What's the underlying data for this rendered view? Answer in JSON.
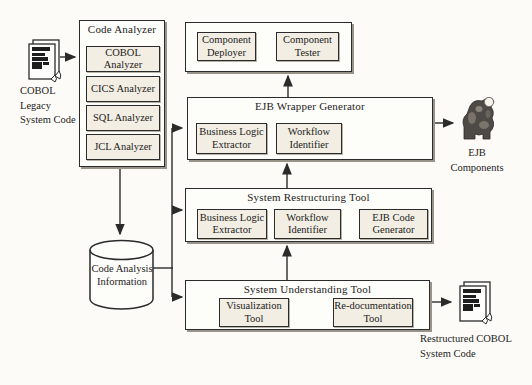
{
  "colors": {
    "line": "#2b2b2b",
    "outer_box_fill": "#fdfdfa",
    "inner_box_fill": "#f2eee4",
    "background": "#fcfbf8"
  },
  "nodes": {
    "cobol_legacy_code": {
      "icon": "document-stack-icon",
      "label": "COBOL\nLegacy\nSystem Code"
    },
    "code_analyzer": {
      "title": "Code Analyzer",
      "analyzers": [
        {
          "label": "COBOL Analyzer"
        },
        {
          "label": "CICS Analyzer"
        },
        {
          "label": "SQL Analyzer"
        },
        {
          "label": "JCL Analyzer"
        }
      ]
    },
    "component_group": {
      "items": [
        {
          "label": "Component\nDeployer"
        },
        {
          "label": "Component\nTester"
        }
      ]
    },
    "ejb_wrapper_generator": {
      "title": "EJB Wrapper Generator",
      "items": [
        {
          "label": "Business Logic\nExtractor"
        },
        {
          "label": "Workflow\nIdentifier"
        }
      ]
    },
    "system_restructuring_tool": {
      "title": "System Restructuring Tool",
      "items": [
        {
          "label": "Business Logic\nExtractor"
        },
        {
          "label": "Workflow\nIdentifier"
        },
        {
          "label": "EJB Code\nGenerator"
        }
      ]
    },
    "system_understanding_tool": {
      "title": "System Understanding Tool",
      "items": [
        {
          "label": "Visualization\nTool"
        },
        {
          "label": "Re-documentation\nTool"
        }
      ]
    },
    "code_analysis_information": {
      "shape": "database-cylinder",
      "label": "Code Analysis\nInformation"
    },
    "ejb_components": {
      "icon": "gorilla-icon",
      "label": "EJB\nComponents"
    },
    "restructured_cobol_code": {
      "icon": "document-stack-icon",
      "label": "Restructured COBOL\nSystem Code"
    }
  }
}
